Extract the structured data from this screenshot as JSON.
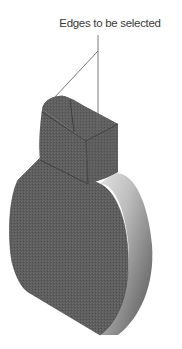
{
  "figure": {
    "callout": {
      "label": "Edges to be selected",
      "line_color": "#6a6a6a"
    },
    "part": {
      "description": "Cylindrical disk body with rectangular boss on top, rounded top-left edge",
      "colors": {
        "face_dark": "#5c5c5c",
        "face_mid": "#666666",
        "cylinder_light": "#d9d9d9",
        "cylinder_shadow": "#5a5a5a",
        "edge": "#3c3c3c",
        "background": "#ffffff"
      }
    }
  }
}
